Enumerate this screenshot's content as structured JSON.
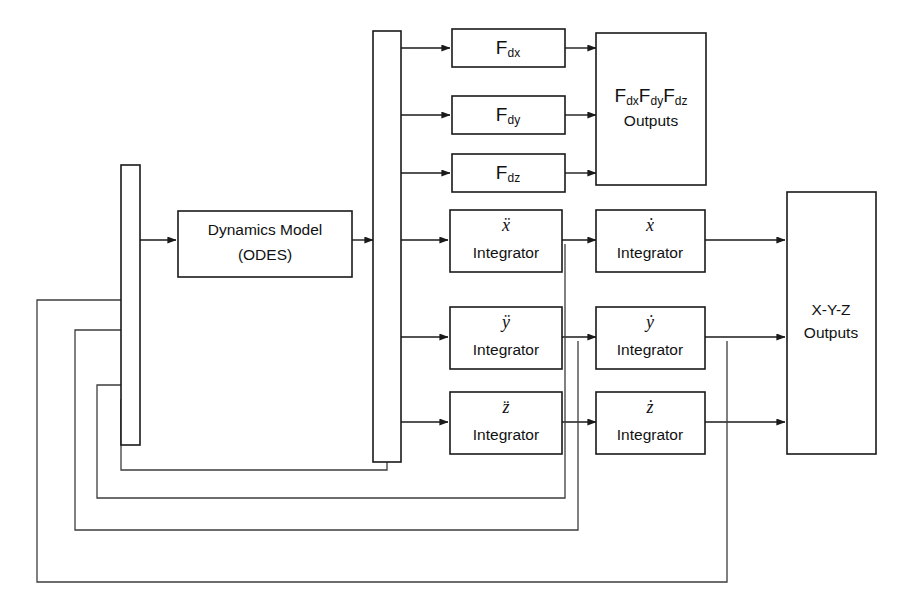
{
  "diagram": {
    "type": "block-diagram",
    "canvas": {
      "width": 910,
      "height": 610,
      "background": "#ffffff"
    },
    "line_color": "#1a1a1a",
    "blocks": {
      "dynamics_model": {
        "line1": "Dynamics Model",
        "line2": "(ODES)"
      },
      "input_bus": {
        "label": ""
      },
      "distribution_bus": {
        "label": ""
      },
      "fdx": {
        "base": "F",
        "sub": "dx"
      },
      "fdy": {
        "base": "F",
        "sub": "dy"
      },
      "fdz": {
        "base": "F",
        "sub": "dz"
      },
      "fd_outputs": {
        "line1_a": "F",
        "line1_a_sub": "dx",
        "line1_b": "F",
        "line1_b_sub": "dy",
        "line1_c": "F",
        "line1_c_sub": "dz",
        "line2": "Outputs"
      },
      "xddot_integrator": {
        "var": "ẍ",
        "label": "Integrator"
      },
      "yddot_integrator": {
        "var": "ÿ",
        "label": "Integrator"
      },
      "zddot_integrator": {
        "var": "z̈",
        "label": "Integrator"
      },
      "xdot_integrator": {
        "var": "ẋ",
        "label": "Integrator"
      },
      "ydot_integrator": {
        "var": "ẏ",
        "label": "Integrator"
      },
      "zdot_integrator": {
        "var": "ż",
        "label": "Integrator"
      },
      "xyz_outputs": {
        "line1": "X-Y-Z",
        "line2": "Outputs"
      }
    },
    "connections": [
      {
        "name": "input-bus-to-dynamics-model",
        "from": "input_bus",
        "to": "dynamics_model",
        "arrow": true
      },
      {
        "name": "dynamics-model-to-distribution-bus",
        "from": "dynamics_model",
        "to": "distribution_bus",
        "arrow": true
      },
      {
        "name": "distribution-bus-to-fdx",
        "from": "distribution_bus",
        "to": "fdx",
        "arrow": true
      },
      {
        "name": "distribution-bus-to-fdy",
        "from": "distribution_bus",
        "to": "fdy",
        "arrow": true
      },
      {
        "name": "distribution-bus-to-fdz",
        "from": "distribution_bus",
        "to": "fdz",
        "arrow": true
      },
      {
        "name": "fdx-to-fd-outputs",
        "from": "fdx",
        "to": "fd_outputs",
        "arrow": true
      },
      {
        "name": "fdy-to-fd-outputs",
        "from": "fdy",
        "to": "fd_outputs",
        "arrow": true
      },
      {
        "name": "fdz-to-fd-outputs",
        "from": "fdz",
        "to": "fd_outputs",
        "arrow": true
      },
      {
        "name": "distribution-bus-to-xddot",
        "from": "distribution_bus",
        "to": "xddot_integrator",
        "arrow": true
      },
      {
        "name": "distribution-bus-to-yddot",
        "from": "distribution_bus",
        "to": "yddot_integrator",
        "arrow": true
      },
      {
        "name": "distribution-bus-to-zddot",
        "from": "distribution_bus",
        "to": "zddot_integrator",
        "arrow": true
      },
      {
        "name": "xddot-to-xdot",
        "from": "xddot_integrator",
        "to": "xdot_integrator",
        "arrow": true
      },
      {
        "name": "yddot-to-ydot",
        "from": "yddot_integrator",
        "to": "ydot_integrator",
        "arrow": true
      },
      {
        "name": "zddot-to-zdot",
        "from": "zddot_integrator",
        "to": "zdot_integrator",
        "arrow": true
      },
      {
        "name": "xdot-to-xyz-outputs",
        "from": "xdot_integrator",
        "to": "xyz_outputs",
        "arrow": true
      },
      {
        "name": "ydot-to-xyz-outputs",
        "from": "ydot_integrator",
        "to": "xyz_outputs",
        "arrow": true
      },
      {
        "name": "zdot-to-xyz-outputs",
        "from": "zdot_integrator",
        "to": "xyz_outputs",
        "arrow": true
      },
      {
        "name": "feedback-distribution-bus-to-input-bus",
        "from": "distribution_bus",
        "to": "input_bus",
        "arrow": true,
        "kind": "feedback"
      },
      {
        "name": "feedback-xddot-to-input-bus",
        "from": "xddot_integrator",
        "to": "input_bus",
        "arrow": true,
        "kind": "feedback"
      },
      {
        "name": "feedback-yddot-to-input-bus",
        "from": "yddot_integrator",
        "to": "input_bus",
        "arrow": true,
        "kind": "feedback"
      },
      {
        "name": "feedback-ydot-to-input-bus",
        "from": "ydot_integrator",
        "to": "input_bus",
        "arrow": true,
        "kind": "feedback"
      }
    ]
  }
}
